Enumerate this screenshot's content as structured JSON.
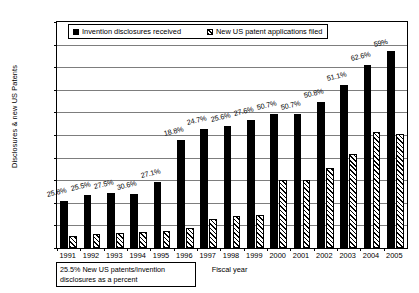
{
  "chart_data": {
    "type": "bar",
    "title": "",
    "xlabel": "Fiscal year",
    "ylabel": "Disclosures & new US Patents",
    "ylim": [
      0,
      20000
    ],
    "ytick_step": 2000,
    "grid": true,
    "legend_position": "top-left-inside",
    "categories": [
      "1991",
      "1992",
      "1993",
      "1994",
      "1995",
      "1996",
      "1997",
      "1998",
      "1999",
      "2000",
      "2001",
      "2002",
      "2003",
      "2004",
      "2005"
    ],
    "series": [
      {
        "name": "Invention disclosures received",
        "style": "solid-black",
        "values": [
          4200,
          4650,
          4850,
          4800,
          5850,
          9600,
          10500,
          10800,
          11300,
          11900,
          11900,
          12900,
          14400,
          16200,
          17400
        ]
      },
      {
        "name": "New US patent applications filed",
        "style": "hatched",
        "values": [
          1100,
          1200,
          1350,
          1400,
          1550,
          1800,
          2600,
          2800,
          2950,
          6000,
          6050,
          7100,
          8300,
          10300,
          10100
        ]
      }
    ],
    "annotations": {
      "description": "Percent labels above each black bar: new US patents / invention disclosures",
      "values": [
        "25.8%",
        "25.5%",
        "27.5%",
        "30.6%",
        "27.1%",
        "18.8%",
        "24.7%",
        "25.6%",
        "27.6%",
        "50.7%",
        "50.7%",
        "50.8%",
        "51.1%",
        "62.6%",
        "59%"
      ]
    },
    "ytick_labels": [
      "0",
      "2000",
      "4000",
      "6000",
      "8000",
      "10000",
      "12000",
      "14000",
      "16000",
      "18000",
      "20000"
    ]
  },
  "legend": {
    "items": [
      {
        "label": "Invention disclosures received",
        "swatch": "solid"
      },
      {
        "label": "New US patent applications filed",
        "swatch": "hatch"
      }
    ]
  },
  "footnote": {
    "line1": "25.5%  New US patents/invention",
    "line2": "disclosures as a percent"
  }
}
